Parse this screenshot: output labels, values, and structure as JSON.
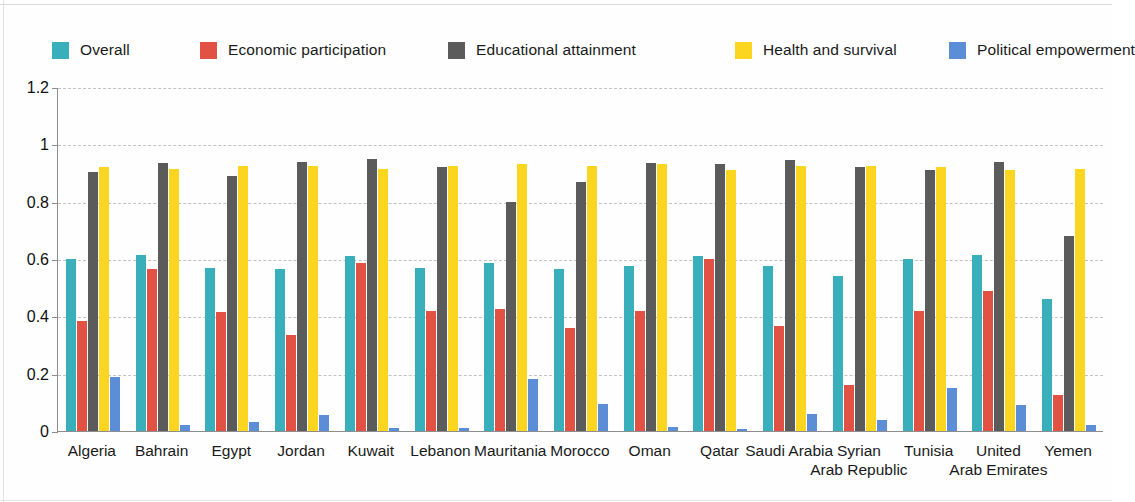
{
  "chart_data": {
    "type": "bar",
    "title": "",
    "subtitle": "",
    "xlabel": "",
    "ylabel": "",
    "ylim": [
      0,
      1.2
    ],
    "y_ticks": [
      "0",
      "0.2",
      "0.4",
      "0.6",
      "0.8",
      "1",
      "1.2"
    ],
    "y_tick_values": [
      0,
      0.2,
      0.4,
      0.6,
      0.8,
      1,
      1.2
    ],
    "grid": true,
    "legend_position": "top",
    "orientation": "vertical",
    "categories": [
      "Algeria",
      "Bahrain",
      "Egypt",
      "Jordan",
      "Kuwait",
      "Lebanon",
      "Mauritania",
      "Morocco",
      "Oman",
      "Qatar",
      "Saudi Arabia",
      "Syrian\nArab Republic",
      "Tunisia",
      "United\nArab Emirates",
      "Yemen"
    ],
    "series": [
      {
        "name": "Overall",
        "color": "#3aafbc",
        "values": [
          0.6,
          0.615,
          0.57,
          0.565,
          0.61,
          0.57,
          0.585,
          0.565,
          0.575,
          0.61,
          0.575,
          0.54,
          0.6,
          0.615,
          0.46
        ]
      },
      {
        "name": "Economic participation",
        "color": "#e15244",
        "values": [
          0.385,
          0.565,
          0.415,
          0.335,
          0.585,
          0.42,
          0.425,
          0.36,
          0.42,
          0.6,
          0.365,
          0.16,
          0.42,
          0.49,
          0.125
        ]
      },
      {
        "name": "Educational attainment",
        "color": "#5b5b5b",
        "values": [
          0.905,
          0.935,
          0.89,
          0.94,
          0.95,
          0.92,
          0.8,
          0.87,
          0.935,
          0.93,
          0.945,
          0.92,
          0.91,
          0.94,
          0.68
        ]
      },
      {
        "name": "Health and survival",
        "color": "#fcd520",
        "values": [
          0.92,
          0.915,
          0.925,
          0.925,
          0.915,
          0.925,
          0.93,
          0.925,
          0.93,
          0.91,
          0.925,
          0.925,
          0.92,
          0.91,
          0.915
        ]
      },
      {
        "name": "Political empowerment",
        "color": "#5b8ed6",
        "values": [
          0.19,
          0.02,
          0.03,
          0.055,
          0.01,
          0.012,
          0.18,
          0.095,
          0.015,
          0.008,
          0.06,
          0.04,
          0.15,
          0.09,
          0.02
        ]
      }
    ]
  },
  "legend": {
    "items": [
      {
        "label": "Overall",
        "color": "#3aafbc"
      },
      {
        "label": "Economic participation",
        "color": "#e15244"
      },
      {
        "label": "Educational attainment",
        "color": "#5b5b5b"
      },
      {
        "label": "Health and survival",
        "color": "#fcd520"
      },
      {
        "label": "Political empowerment",
        "color": "#5b8ed6"
      }
    ]
  },
  "axis": {
    "y_tick_labels": [
      "1.2",
      "1",
      "0.8",
      "0.6",
      "0.4",
      "0.2",
      "0"
    ]
  }
}
